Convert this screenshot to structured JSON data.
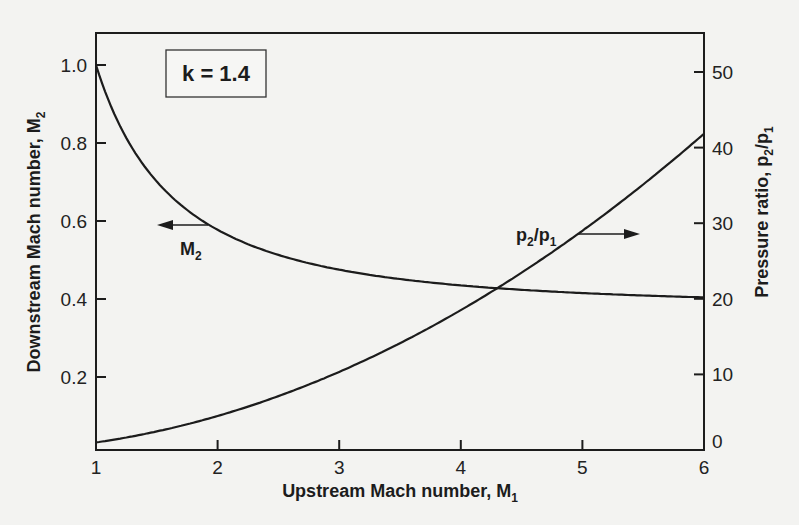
{
  "chart_data": {
    "type": "line",
    "title": "",
    "xlabel": "Upstream Mach number, M",
    "xlabel_sub": "1",
    "ylabel_left": "Downstream Mach number, M",
    "ylabel_left_sub": "2",
    "ylabel_right": "Pressure ratio, p",
    "ylabel_right_sub_a": "2",
    "ylabel_right_mid": "/p",
    "ylabel_right_sub_b": "1",
    "xlim": [
      1,
      6
    ],
    "ylim_left": [
      0.013,
      1.0
    ],
    "ylim_right": [
      0,
      55
    ],
    "grid": false,
    "x_ticks": [
      "1",
      "2",
      "3",
      "4",
      "5",
      "6"
    ],
    "y_left_ticks": [
      "0.2",
      "0.4",
      "0.6",
      "0.8",
      "1.0"
    ],
    "y_right_ticks": [
      "0",
      "10",
      "20",
      "30",
      "40",
      "50"
    ],
    "annotation_box": {
      "text": "k = 1.4"
    },
    "x": [
      1.0,
      1.5,
      2.0,
      2.5,
      3.0,
      3.5,
      4.0,
      4.5,
      5.0,
      5.5,
      6.0
    ],
    "series": [
      {
        "name": "M2",
        "axis": "left",
        "label": "M",
        "label_sub": "2",
        "arrow_direction": "left",
        "values": [
          1.0,
          0.701,
          0.577,
          0.513,
          0.475,
          0.451,
          0.435,
          0.424,
          0.415,
          0.409,
          0.404
        ]
      },
      {
        "name": "p2/p1",
        "axis": "right",
        "label_a": "p",
        "label_sub_a": "2",
        "label_mid": "/p",
        "label_sub_b": "1",
        "arrow_direction": "right",
        "values": [
          1.0,
          2.46,
          4.5,
          7.13,
          10.33,
          14.13,
          18.5,
          23.46,
          29.0,
          35.13,
          41.83
        ]
      }
    ]
  }
}
